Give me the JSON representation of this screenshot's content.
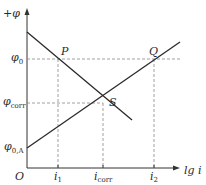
{
  "diagram": {
    "type": "evans-polarization-diagram",
    "y_axis": {
      "label": "+φ"
    },
    "x_axis": {
      "label": "lg i"
    },
    "origin": {
      "label": "O"
    },
    "y_ticks": [
      {
        "label": "φ",
        "sub": "0",
        "y": 59
      },
      {
        "label": "φ",
        "sub": "corr",
        "y": 103
      },
      {
        "label": "φ",
        "sub": "0,A",
        "y": 148
      }
    ],
    "x_ticks": [
      {
        "label": "i",
        "sub": "1",
        "x": 58
      },
      {
        "label": "i",
        "sub": "corr",
        "x": 103
      },
      {
        "label": "i",
        "sub": "2",
        "x": 154
      }
    ],
    "points": [
      {
        "label": "P",
        "x": 58,
        "y": 59
      },
      {
        "label": "Q",
        "x": 154,
        "y": 59
      },
      {
        "label": "S",
        "x": 103,
        "y": 103
      }
    ],
    "lines": [
      {
        "name": "cathodic-line",
        "from": [
          27,
          32
        ],
        "to": [
          132,
          120
        ]
      },
      {
        "name": "anodic-line",
        "from": [
          27,
          148
        ],
        "to": [
          180,
          42
        ]
      }
    ],
    "colors": {
      "line": "#2a2a2a",
      "dash": "#888888",
      "background": "#ffffff"
    }
  }
}
